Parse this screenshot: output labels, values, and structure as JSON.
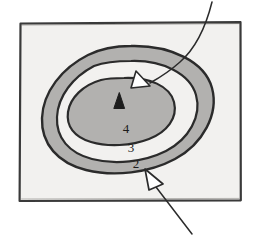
{
  "figure": {
    "type": "diagram",
    "background_color": "#ffffff",
    "paper_color": "#f2f1ef",
    "ink_color": "#2b2b2b",
    "band_fill_color": "#b2b1af",
    "core_fill_color": "#b2b1af",
    "gap_fill_color": "#f2f1ef"
  },
  "frame": {
    "name": "sketch-border",
    "x": 19,
    "y": 22,
    "width": 222,
    "height": 179,
    "stroke_color": "#3a3a3a"
  },
  "contours": {
    "label_prefix": "contour",
    "rings": [
      {
        "id": "ring-outer",
        "level_label": "2",
        "label_x": 136,
        "label_y": 168,
        "fill": "#b2b1af",
        "description": "outermost closed contour line, outer edge of shaded band"
      },
      {
        "id": "ring-middle",
        "level_label": "3",
        "label_x": 131,
        "label_y": 152,
        "fill": "#f2f1ef",
        "description": "middle closed contour line, inner edge of shaded band"
      },
      {
        "id": "ring-inner",
        "level_label": "4",
        "label_x": 126,
        "label_y": 133,
        "fill": "#b2b1af",
        "description": "innermost closed contour line enclosing the summit"
      }
    ]
  },
  "markers": {
    "summit": {
      "name": "summit-peak-marker",
      "symbol": "filled-triangle",
      "x": 119,
      "y": 101,
      "fill": "#1c1c1c",
      "description": "solid black triangle marking the summit point"
    }
  },
  "annotations": [
    {
      "id": "annotation-top",
      "name": "leader-line-summit",
      "arrowhead": "hollow-triangle",
      "arrow_x": 142,
      "arrow_y": 80,
      "leader_from_x": 212,
      "leader_from_y": 2,
      "leader_to_x": 149,
      "leader_to_y": 84,
      "description": "curved leader line from upper right pointing at the inner contour near the summit"
    },
    {
      "id": "annotation-bottom",
      "name": "leader-line-outer-contour",
      "arrowhead": "hollow-triangle",
      "arrow_x": 152,
      "arrow_y": 176,
      "leader_from_x": 192,
      "leader_from_y": 234,
      "leader_to_x": 155,
      "leader_to_y": 186,
      "description": "straight leader line from lower right pointing at the outer contour line labelled 2"
    }
  ]
}
